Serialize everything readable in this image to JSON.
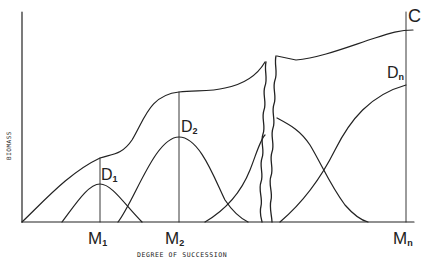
{
  "axes": {
    "y_label": "BIOMASS",
    "x_label": "DEGREE OF SUCCESSION"
  },
  "x_ticks": [
    {
      "main": "M",
      "sub": "1"
    },
    {
      "main": "M",
      "sub": "2"
    },
    {
      "main": "M",
      "sub": "n"
    }
  ],
  "curve_labels": {
    "cumulative": {
      "main": "C",
      "sub": ""
    },
    "d1": {
      "main": "D",
      "sub": "1"
    },
    "d2": {
      "main": "D",
      "sub": "2"
    },
    "dn": {
      "main": "D",
      "sub": "n"
    }
  },
  "colors": {
    "line": "#222222",
    "background": "#ffffff"
  }
}
